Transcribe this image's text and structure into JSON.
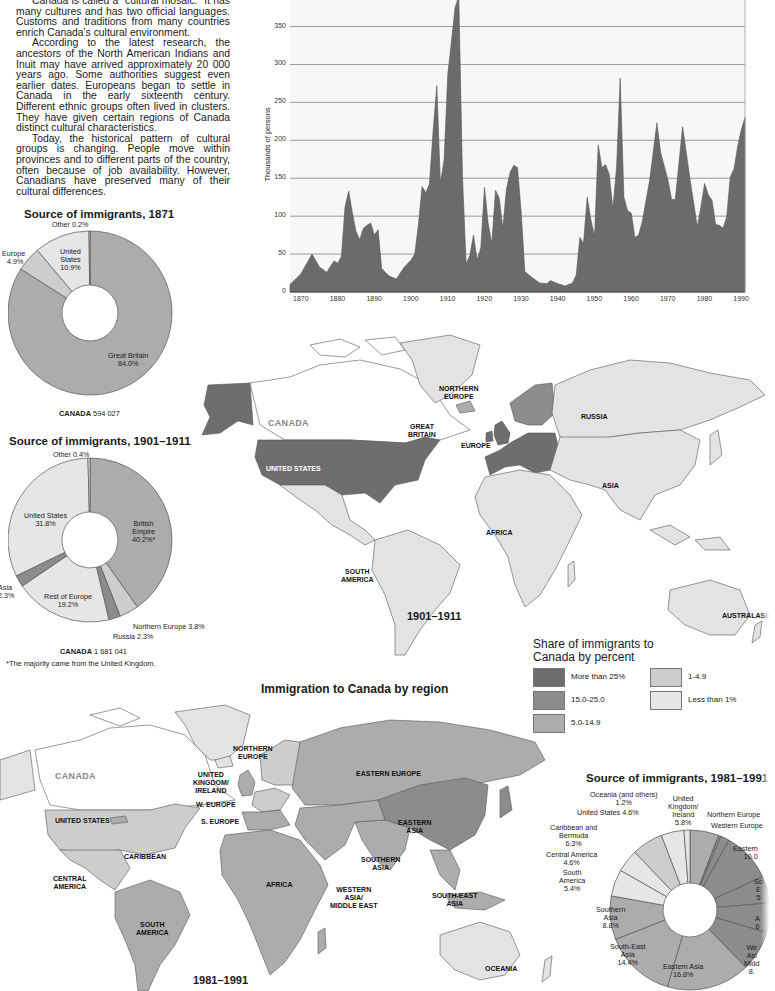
{
  "intro": {
    "paragraphs": [
      "Canada is called a \"cultural mosaic.\" It has many cultures and has two official languages. Customs and traditions from many countries enrich Canada's cultural environment.",
      "According to the latest research, the ancestors of the North American Indians and Inuit may have arrived approximately 20 000 years ago. Some authorities suggest even earlier dates. Europeans began to settle in Canada in the early sixteenth century. Different ethnic groups often lived in clusters. They have given certain regions of Canada distinct cultural characteristics.",
      "Today, the historical pattern of cultural groups is changing. People move within provinces and to different parts of the country, often because of job availability. However, Canadians have preserved many of their cultural differences."
    ]
  },
  "pie1871": {
    "title": "Source of immigrants, 1871",
    "labels": {
      "other": "Other 0.2%",
      "europe_name": "Europe",
      "europe_pct": "4.9%",
      "us_1": "United",
      "us_2": "States",
      "us_pct": "10.9%",
      "gb_name": "Great Britain",
      "gb_pct": "84.0%"
    },
    "caption_bold": "CANADA",
    "caption_value": "594 027"
  },
  "pie1901": {
    "title": "Source of immigrants, 1901–1911",
    "labels": {
      "other": "Other 0.4%",
      "us_name": "United States",
      "us_pct": "31.8%",
      "be_1": "British",
      "be_2": "Empire",
      "be_pct": "40.2%*",
      "asia_name": "Asia",
      "asia_pct": "2.3%",
      "roe_name": "Rest of Europe",
      "roe_pct": "19.2%",
      "ne": "Northern Europe 3.8%",
      "russia": "Russia 2.3%"
    },
    "caption_bold": "CANADA",
    "caption_value": "1 681 041",
    "footnote": "*The majority came from the United Kingdom."
  },
  "area_chart": {
    "ylabel": "Thousands of persons",
    "yticks": [
      "0",
      "50",
      "100",
      "150",
      "200",
      "250",
      "300",
      "350"
    ],
    "xticks": [
      "1870",
      "1880",
      "1890",
      "1900",
      "1910",
      "1920",
      "1930",
      "1940",
      "1950",
      "1960",
      "1970",
      "1980",
      "1990"
    ]
  },
  "map1901": {
    "period": "1901–1911",
    "labels": {
      "canada": "CANADA",
      "us": "UNITED STATES",
      "ne_1": "NORTHERN",
      "ne_2": "EUROPE",
      "gb_1": "GREAT",
      "gb_2": "BRITAIN",
      "europe": "EUROPE",
      "russia": "RUSSIA",
      "asia": "ASIA",
      "africa": "AFRICA",
      "sa_1": "SOUTH",
      "sa_2": "AMERICA",
      "australasia": "AUSTRALASIA"
    }
  },
  "legend": {
    "title_1": "Share of immigrants to",
    "title_2": "Canada by percent",
    "items": [
      {
        "label": "More than 25%",
        "color": "#6e6e6e"
      },
      {
        "label": "15.0-25.0",
        "color": "#8c8c8c"
      },
      {
        "label": "5.0-14.9",
        "color": "#acacac"
      },
      {
        "label": "1-4.9",
        "color": "#cdcdcd"
      },
      {
        "label": "Less than 1%",
        "color": "#e6e6e6"
      }
    ]
  },
  "section_title": "Immigration to Canada by region",
  "map1981": {
    "period": "1981–1991",
    "labels": {
      "canada": "CANADA",
      "us": "UNITED STATES",
      "ne_1": "NORTHERN",
      "ne_2": "EUROPE",
      "uk_1": "UNITED",
      "uk_2": "KINGDOM/",
      "uk_3": "IRELAND",
      "we": "W. EUROPE",
      "se": "S. EUROPE",
      "ee": "EASTERN EUROPE",
      "ea_1": "EASTERN",
      "ea_2": "ASIA",
      "caribbean": "CARIBBEAN",
      "ca_1": "CENTRAL",
      "ca_2": "AMERICA",
      "africa": "AFRICA",
      "sas_1": "SOUTHERN",
      "sas_2": "ASIA",
      "wa_1": "WESTERN",
      "wa_2": "ASIA/",
      "wa_3": "MIDDLE EAST",
      "sea_1": "SOUTH-EAST",
      "sea_2": "ASIA",
      "sa_1": "SOUTH",
      "sa_2": "AMERICA",
      "oceania": "OCEANIA"
    }
  },
  "pie1981": {
    "title": "Source of immigrants, 1981–1991",
    "labels": {
      "oceania_1": "Oceania (and others)",
      "oceania_2": "1.2%",
      "us": "United States  4.6%",
      "uk_1": "United",
      "uk_2": "Kingdom/",
      "uk_3": "Ireland",
      "uk_4": "5.8%",
      "ne": "Northern Europe",
      "we": "Western Europe",
      "ee_1": "Eastern",
      "ee_2": "10.0",
      "cb_1": "Caribbean and",
      "cb_2": "Bermuda",
      "cb_3": "6.3%",
      "cam_1": "Central America",
      "cam_2": "4.6%",
      "sam_1": "South",
      "sam_2": "America",
      "sam_3": "5.4%",
      "sas_1": "Southern",
      "sas_2": "Asia",
      "sas_3": "8.8%",
      "sea_1": "South-East",
      "sea_2": "Asia",
      "sea_3": "14.4%",
      "eas_1": "Eastern Asia",
      "eas_2": "16.8%",
      "soe_1": "So",
      "soe_2": "E",
      "soe_3": "5",
      "af_1": "A",
      "af_2": "6",
      "wa_1": "We",
      "wa_2": "Asi",
      "wa_3": "Midd",
      "wa_4": "8."
    }
  },
  "chart_data": [
    {
      "type": "pie",
      "title": "Source of immigrants, 1871",
      "categories": [
        "Great Britain",
        "Europe",
        "United States",
        "Other"
      ],
      "values": [
        84.0,
        4.9,
        10.9,
        0.2
      ],
      "total": "594 027",
      "style": "donut"
    },
    {
      "type": "pie",
      "title": "Source of immigrants, 1901–1911",
      "categories": [
        "British Empire",
        "Northern Europe",
        "Russia",
        "Rest of Europe",
        "Asia",
        "United States",
        "Other"
      ],
      "values": [
        40.2,
        3.8,
        2.3,
        19.2,
        2.3,
        31.8,
        0.4
      ],
      "total": "1 681 041",
      "note": "*The majority came from the United Kingdom.",
      "style": "donut"
    },
    {
      "type": "area",
      "title": "",
      "xlabel": "",
      "ylabel": "Thousands of persons",
      "xlim": [
        1867,
        1991
      ],
      "ylim": [
        0,
        390
      ],
      "grid": true,
      "x": [
        1867,
        1870,
        1873,
        1875,
        1877,
        1879,
        1880,
        1881,
        1882,
        1883,
        1884,
        1885,
        1886,
        1887,
        1888,
        1889,
        1890,
        1891,
        1892,
        1894,
        1896,
        1898,
        1900,
        1901,
        1902,
        1903,
        1904,
        1905,
        1906,
        1907,
        1908,
        1909,
        1910,
        1911,
        1912,
        1913,
        1914,
        1915,
        1916,
        1917,
        1918,
        1919,
        1920,
        1921,
        1922,
        1923,
        1924,
        1925,
        1926,
        1927,
        1928,
        1929,
        1930,
        1931,
        1933,
        1935,
        1937,
        1938,
        1940,
        1942,
        1944,
        1945,
        1946,
        1947,
        1948,
        1949,
        1950,
        1951,
        1952,
        1953,
        1954,
        1955,
        1956,
        1957,
        1958,
        1959,
        1960,
        1961,
        1962,
        1963,
        1965,
        1967,
        1968,
        1970,
        1971,
        1972,
        1974,
        1976,
        1978,
        1979,
        1980,
        1981,
        1982,
        1983,
        1984,
        1985,
        1986,
        1987,
        1988,
        1989,
        1990,
        1991
      ],
      "values": [
        10,
        24,
        50,
        33,
        26,
        41,
        38,
        47,
        112,
        133,
        104,
        80,
        69,
        84,
        88,
        91,
        75,
        82,
        31,
        21,
        17,
        32,
        42,
        50,
        89,
        139,
        131,
        142,
        212,
        272,
        143,
        174,
        287,
        331,
        375,
        401,
        151,
        37,
        48,
        75,
        42,
        58,
        138,
        91,
        64,
        134,
        124,
        84,
        136,
        158,
        167,
        164,
        105,
        27,
        19,
        12,
        11,
        15,
        11,
        8,
        12,
        22,
        72,
        64,
        125,
        95,
        74,
        194,
        164,
        168,
        155,
        110,
        165,
        282,
        125,
        107,
        104,
        72,
        75,
        93,
        147,
        223,
        184,
        148,
        122,
        122,
        218,
        149,
        86,
        113,
        143,
        128,
        121,
        89,
        88,
        84,
        99,
        152,
        162,
        192,
        214,
        230
      ]
    },
    {
      "type": "pie",
      "title": "Source of immigrants, 1981–1991",
      "categories": [
        "United Kingdom/Ireland",
        "Northern Europe",
        "Western Europe",
        "Eastern Europe",
        "Southern Europe",
        "Africa",
        "Western Asia/Middle East",
        "Eastern Asia",
        "South-East Asia",
        "Southern Asia",
        "South America",
        "Central America",
        "Caribbean and Bermuda",
        "United States",
        "Oceania (and others)"
      ],
      "values": [
        5.8,
        0.5,
        1.8,
        10.0,
        5.4,
        6.0,
        8.1,
        16.8,
        14.4,
        8.8,
        5.4,
        4.6,
        6.3,
        4.6,
        1.2
      ],
      "note": "Right-side labels partially cut off in image; Northern/Western/Southern Europe, Africa, Western Asia values estimated",
      "style": "donut"
    }
  ]
}
